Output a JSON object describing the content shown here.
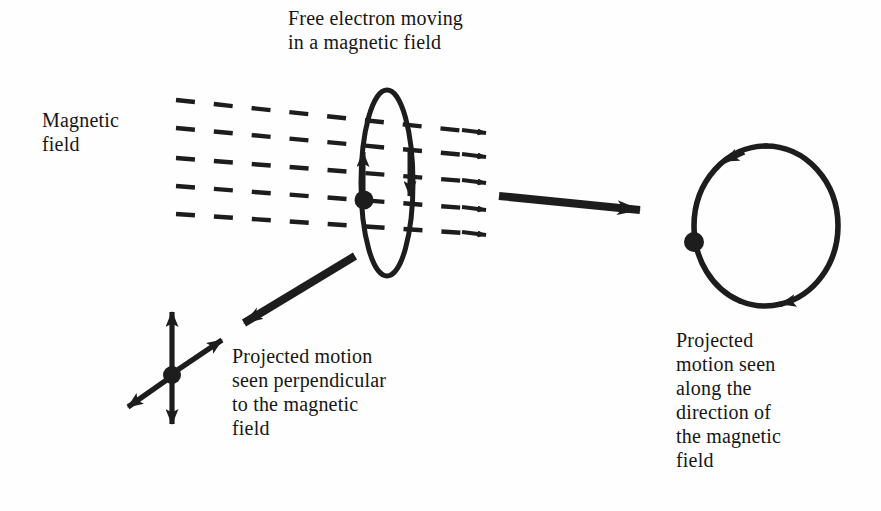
{
  "figure": {
    "title": "Free electron moving\nin a magnetic field",
    "background_color": "#fefefe",
    "ink_color": "#1d1d1d",
    "width": 881,
    "height": 511
  },
  "labels": {
    "magnetic_field": "Magnetic\nfield",
    "projected_perpendicular": "Projected motion\nseen perpendicular\nto the magnetic\nfield",
    "projected_along": "Projected\nmotion seen\nalong the\ndirection of\nthe magnetic\nfield"
  },
  "diagram": {
    "field_lines": {
      "name": "magnetic-field-lines",
      "count": 5,
      "style": "dashed",
      "direction": "left-to-right",
      "arrowheads": "right-end",
      "dashes_per_line": 8
    },
    "helix_orbit": {
      "name": "electron-orbit-ellipse",
      "shape": "ellipse",
      "center_x": 387,
      "center_y": 183,
      "radius_x": 26,
      "radius_y": 93,
      "rotation_arrow_up": "left-side-upward",
      "rotation_arrow_down": "right-side-downward"
    },
    "electron_on_ellipse": {
      "name": "electron-dot-ellipse",
      "x": 364,
      "y": 200,
      "radius": 9
    },
    "projection_circle": {
      "name": "projected-orbit-circle",
      "center_x": 766,
      "center_y": 226,
      "radius_x": 72,
      "radius_y": 80,
      "circulation": "counterclockwise",
      "arrow_positions": [
        "upper-left",
        "lower-right"
      ]
    },
    "electron_on_circle": {
      "name": "electron-dot-circle",
      "x": 694,
      "y": 242,
      "radius": 10
    },
    "projection_cross": {
      "name": "projected-motion-cross",
      "center_x": 172,
      "center_y": 375,
      "vertical_arrow": "double-headed",
      "diagonal_arrow": "double-headed"
    },
    "pointer_arrows": [
      {
        "name": "pointer-to-circle",
        "from_x": 499,
        "from_y": 197,
        "to_x": 648,
        "to_y": 211
      },
      {
        "name": "pointer-to-cross",
        "from_x": 353,
        "from_y": 257,
        "to_x": 232,
        "to_y": 330
      }
    ]
  }
}
